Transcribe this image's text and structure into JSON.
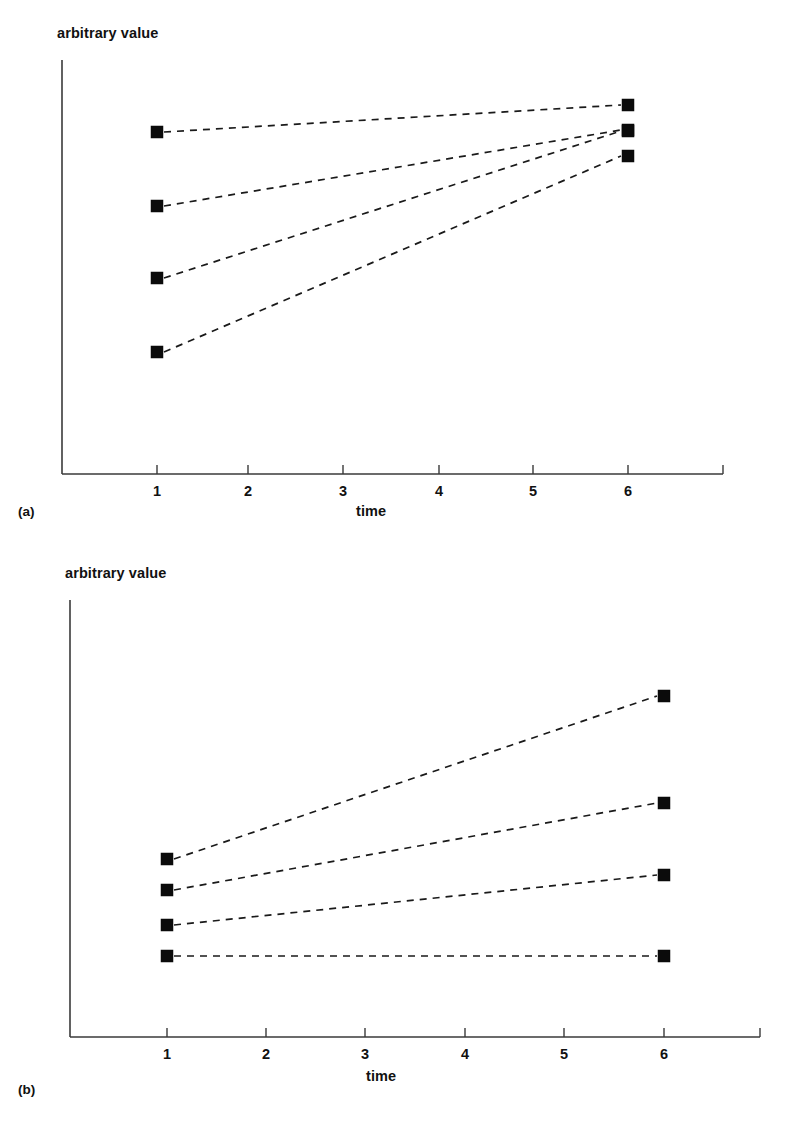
{
  "figure": {
    "background": "#ffffff",
    "ink_color": "#111111",
    "marker_color": "#0b0b0b",
    "axis_color": "#3a3a3a"
  },
  "panels": [
    {
      "id": "a",
      "caption": "(a)",
      "y_axis_label": "arbitrary value",
      "x_axis_label": "time"
    },
    {
      "id": "b",
      "caption": "(b)",
      "y_axis_label": "arbitrary value",
      "x_axis_label": "time"
    }
  ],
  "chart_data": [
    {
      "type": "line",
      "title": "",
      "panel": "(a)",
      "xlabel": "time",
      "ylabel": "arbitrary value",
      "x": [
        1,
        6
      ],
      "tick_labels": [
        "1",
        "2",
        "3",
        "4",
        "5",
        "6"
      ],
      "xlim": [
        0.3,
        6.9
      ],
      "ylim": [
        0,
        100
      ],
      "grid": false,
      "legend": "none",
      "marker": "filled-square",
      "linestyle": "dashed",
      "series": [
        {
          "name": "line-1",
          "values": [
            78,
            93
          ]
        },
        {
          "name": "line-2",
          "values": [
            61,
            87
          ]
        },
        {
          "name": "line-3",
          "values": [
            45,
            87
          ]
        },
        {
          "name": "line-4",
          "values": [
            28,
            82
          ]
        }
      ]
    },
    {
      "type": "line",
      "title": "",
      "panel": "(b)",
      "xlabel": "time",
      "ylabel": "arbitrary value",
      "x": [
        1,
        6
      ],
      "tick_labels": [
        "1",
        "2",
        "3",
        "4",
        "5",
        "6"
      ],
      "xlim": [
        0.3,
        6.9
      ],
      "ylim": [
        0,
        100
      ],
      "grid": false,
      "legend": "none",
      "marker": "filled-square",
      "linestyle": "dashed",
      "series": [
        {
          "name": "line-1",
          "values": [
            41,
            78
          ]
        },
        {
          "name": "line-2",
          "values": [
            34,
            54
          ]
        },
        {
          "name": "line-3",
          "values": [
            26,
            37
          ]
        },
        {
          "name": "line-4",
          "values": [
            19,
            19
          ]
        }
      ]
    }
  ],
  "geometry": {
    "panel_a": {
      "axis_origin": {
        "x": 62,
        "y": 474
      },
      "y_axis_top": 60,
      "x_axis_right": 723,
      "tick_positions": [
        157,
        248,
        343,
        439,
        533,
        628
      ],
      "points": {
        "left_x": 157,
        "right_x": 628,
        "left_y": [
          132,
          206,
          278,
          352
        ],
        "right_y": [
          105,
          130,
          131,
          156
        ]
      },
      "labels": {
        "y_label_left": 57,
        "y_label_top": 25,
        "x_label_left": 356,
        "x_label_top": 503,
        "caption_left": 18,
        "caption_top": 504
      }
    },
    "panel_b": {
      "axis_origin": {
        "x": 70,
        "y": 1037
      },
      "y_axis_top": 600,
      "x_axis_right": 760,
      "tick_positions": [
        167,
        266,
        365,
        465,
        564,
        664
      ],
      "points": {
        "left_x": 167,
        "right_x": 664,
        "left_y": [
          859,
          890,
          925,
          956
        ],
        "right_y": [
          696,
          803,
          875,
          956
        ]
      },
      "labels": {
        "y_label_left": 65,
        "y_label_top": 565,
        "x_label_left": 366,
        "x_label_top": 1068,
        "caption_left": 18,
        "caption_top": 1082
      }
    }
  }
}
